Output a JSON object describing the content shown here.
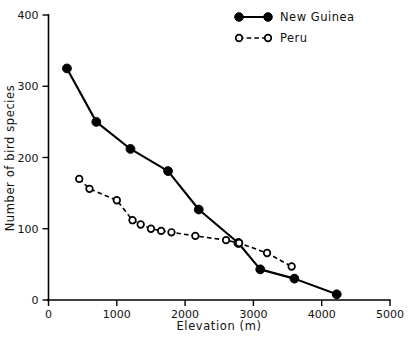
{
  "chart_data": {
    "type": "line",
    "title": "",
    "xlabel": "Elevation (m)",
    "ylabel": "Number of bird species",
    "xlim": [
      0,
      5000
    ],
    "ylim": [
      0,
      400
    ],
    "xticks": [
      0,
      1000,
      2000,
      3000,
      4000,
      5000
    ],
    "xtick_labels": [
      "0",
      "1000",
      "2000",
      "3000",
      "4000",
      "5000"
    ],
    "yticks": [
      0,
      100,
      200,
      300,
      400
    ],
    "ytick_labels": [
      "0",
      "100",
      "200",
      "300",
      "400"
    ],
    "grid": false,
    "legend_position": "top-right",
    "series": [
      {
        "name": "New Guinea",
        "marker": "filled-circle",
        "linestyle": "solid",
        "color": "#000000",
        "points": [
          {
            "x": 270,
            "y": 325
          },
          {
            "x": 700,
            "y": 250
          },
          {
            "x": 1200,
            "y": 212
          },
          {
            "x": 1750,
            "y": 181
          },
          {
            "x": 2200,
            "y": 127
          },
          {
            "x": 2780,
            "y": 80
          },
          {
            "x": 3100,
            "y": 43
          },
          {
            "x": 3600,
            "y": 30
          },
          {
            "x": 4220,
            "y": 8
          }
        ]
      },
      {
        "name": "Peru",
        "marker": "open-circle",
        "linestyle": "dashed",
        "color": "#000000",
        "points": [
          {
            "x": 450,
            "y": 170
          },
          {
            "x": 600,
            "y": 156
          },
          {
            "x": 1000,
            "y": 140
          },
          {
            "x": 1230,
            "y": 112
          },
          {
            "x": 1350,
            "y": 106
          },
          {
            "x": 1500,
            "y": 100
          },
          {
            "x": 1650,
            "y": 97
          },
          {
            "x": 1800,
            "y": 95
          },
          {
            "x": 2150,
            "y": 90
          },
          {
            "x": 2600,
            "y": 84
          },
          {
            "x": 2790,
            "y": 80
          },
          {
            "x": 3200,
            "y": 66
          },
          {
            "x": 3560,
            "y": 47
          }
        ]
      }
    ],
    "legend": [
      {
        "label": "New Guinea",
        "marker": "filled-circle",
        "linestyle": "solid"
      },
      {
        "label": "Peru",
        "marker": "open-circle",
        "linestyle": "dashed"
      }
    ]
  }
}
